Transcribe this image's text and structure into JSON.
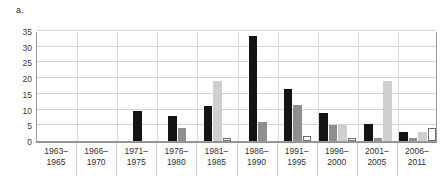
{
  "figure": {
    "panel_label": "a."
  },
  "chart_data": {
    "type": "bar",
    "title": "",
    "xlabel": "",
    "ylabel": "",
    "ylim": [
      0,
      35
    ],
    "yticks": [
      0,
      5,
      10,
      15,
      20,
      25,
      30,
      35
    ],
    "grid": true,
    "legend": "none",
    "categories": [
      "1963–\n1965",
      "1966–\n1970",
      "1971–\n1975",
      "1976–\n1980",
      "1981–\n1985",
      "1986–\n1990",
      "1991–\n1995",
      "1996–\n2000",
      "2001–\n2005",
      "2006–\n2011"
    ],
    "series": [
      {
        "name": "series-1",
        "color": "#141414",
        "values": [
          0,
          0,
          9.5,
          8,
          11,
          33.5,
          16.5,
          9,
          5.5,
          3
        ]
      },
      {
        "name": "series-2",
        "color": "#8e8e8e",
        "values": [
          0,
          0,
          0,
          4,
          0,
          6,
          11.5,
          5,
          1,
          1
        ]
      },
      {
        "name": "series-3",
        "color": "#cfcfcf",
        "values": [
          0,
          0,
          0,
          0,
          19,
          0,
          0,
          5,
          19,
          3
        ]
      },
      {
        "name": "series-4",
        "color": "#ffffff",
        "values": [
          0,
          0,
          0,
          0,
          1,
          0,
          1.5,
          1,
          0,
          4
        ]
      }
    ]
  }
}
